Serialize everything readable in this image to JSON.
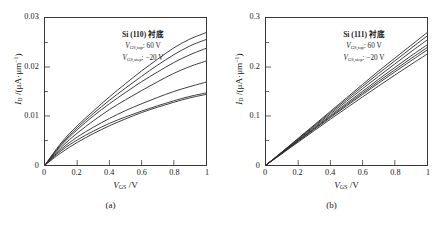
{
  "figure": {
    "panels": [
      {
        "caption": "(a)",
        "annotation": {
          "substrate": "Si (110) 衬底",
          "vgs_top_symbol": "V",
          "vgs_top_sub": "GS,top",
          "vgs_top_value": ": 60 V",
          "vgs_step_symbol": "V",
          "vgs_step_sub": "GS,step",
          "vgs_step_value": ": −20 V"
        },
        "axes": {
          "x_title_symbol": "V",
          "x_title_sub": "GS",
          "x_title_unit": " /V",
          "y_title_symbol": "I",
          "y_title_sub": "D",
          "y_title_unit": " /(μA·μm",
          "y_title_unit_sup": "−1",
          "y_title_unit_end": ")",
          "xticks": [
            "0",
            "0.2",
            "0.4",
            "0.6",
            "0.8",
            "1"
          ],
          "yticks": [
            "0",
            "0.01",
            "0.02",
            "0.03"
          ]
        },
        "chart_data": {
          "type": "line",
          "title": "Si (110) 衬底",
          "xlabel": "V_GS /V",
          "ylabel": "I_D /(μA·μm⁻¹)",
          "xlim": [
            0,
            1
          ],
          "ylim": [
            0,
            0.03
          ],
          "grid": false,
          "legend": "none",
          "x": [
            0,
            0.1,
            0.2,
            0.3,
            0.4,
            0.5,
            0.6,
            0.7,
            0.8,
            0.9,
            1.0
          ],
          "series": [
            {
              "name": "V_GS = 60 V",
              "values": [
                0,
                0.0045,
                0.008,
                0.011,
                0.0139,
                0.0166,
                0.0192,
                0.0216,
                0.0239,
                0.0257,
                0.027
              ]
            },
            {
              "name": "V_GS = 40 V",
              "values": [
                0,
                0.0042,
                0.0076,
                0.0105,
                0.0132,
                0.0157,
                0.0181,
                0.0204,
                0.0225,
                0.0243,
                0.0256
              ]
            },
            {
              "name": "V_GS = 20 V",
              "values": [
                0,
                0.004,
                0.0072,
                0.01,
                0.0125,
                0.0148,
                0.017,
                0.019,
                0.0209,
                0.0225,
                0.0238
              ]
            },
            {
              "name": "V_GS = 0 V",
              "values": [
                0,
                0.0036,
                0.0065,
                0.009,
                0.0113,
                0.0133,
                0.0152,
                0.017,
                0.0187,
                0.0201,
                0.0212
              ]
            },
            {
              "name": "V_GS = −20 V",
              "values": [
                0,
                0.0032,
                0.0057,
                0.0077,
                0.0095,
                0.0111,
                0.0125,
                0.0138,
                0.015,
                0.016,
                0.0169
              ]
            },
            {
              "name": "V_GS = −40 V",
              "values": [
                0,
                0.0029,
                0.0051,
                0.0069,
                0.0085,
                0.0098,
                0.011,
                0.0121,
                0.0131,
                0.014,
                0.0147
              ]
            },
            {
              "name": "V_GS = −60 V",
              "values": [
                0,
                0.0025,
                0.0046,
                0.0064,
                0.008,
                0.0094,
                0.0107,
                0.0118,
                0.0128,
                0.0137,
                0.0144
              ]
            }
          ]
        }
      },
      {
        "caption": "(b)",
        "annotation": {
          "substrate": "Si (111) 衬底",
          "vgs_top_symbol": "V",
          "vgs_top_sub": "GS,top",
          "vgs_top_value": ": 60 V",
          "vgs_step_symbol": "V",
          "vgs_step_sub": "GS,step",
          "vgs_step_value": ": −20 V"
        },
        "axes": {
          "x_title_symbol": "V",
          "x_title_sub": "GS",
          "x_title_unit": " /V",
          "y_title_symbol": "I",
          "y_title_sub": "D",
          "y_title_unit": " /(μA·μm",
          "y_title_unit_sup": "−1",
          "y_title_unit_end": ")",
          "xticks": [
            "0",
            "0.2",
            "0.4",
            "0.6",
            "0.8",
            "1"
          ],
          "yticks": [
            "0",
            "0.1",
            "0.2",
            "0.3"
          ]
        },
        "chart_data": {
          "type": "line",
          "title": "Si (111) 衬底",
          "xlabel": "V_GS /V",
          "ylabel": "I_D /(μA·μm⁻¹)",
          "xlim": [
            0,
            1
          ],
          "ylim": [
            0,
            0.3
          ],
          "grid": false,
          "legend": "none",
          "x": [
            0,
            0.1,
            0.2,
            0.3,
            0.4,
            0.5,
            0.6,
            0.7,
            0.8,
            0.9,
            1.0
          ],
          "series": [
            {
              "name": "V_GS = 60 V",
              "values": [
                0,
                0.027,
                0.0545,
                0.082,
                0.1095,
                0.137,
                0.1645,
                0.192,
                0.218,
                0.244,
                0.27
              ]
            },
            {
              "name": "V_GS = 40 V",
              "values": [
                0,
                0.0265,
                0.0533,
                0.0802,
                0.107,
                0.1338,
                0.1605,
                0.187,
                0.2125,
                0.238,
                0.263
              ]
            },
            {
              "name": "V_GS = 20 V",
              "values": [
                0,
                0.0258,
                0.052,
                0.0782,
                0.1042,
                0.13,
                0.1558,
                0.1812,
                0.2062,
                0.231,
                0.255
              ]
            },
            {
              "name": "V_GS = 0 V",
              "values": [
                0,
                0.025,
                0.0505,
                0.0758,
                0.101,
                0.1258,
                0.1505,
                0.175,
                0.199,
                0.2225,
                0.245
              ]
            },
            {
              "name": "V_GS = −20 V",
              "values": [
                0,
                0.0245,
                0.0494,
                0.0742,
                0.0988,
                0.123,
                0.147,
                0.1708,
                0.1942,
                0.2172,
                0.2395
              ]
            },
            {
              "name": "V_GS = −40 V",
              "values": [
                0,
                0.024,
                0.0484,
                0.0727,
                0.0968,
                0.1205,
                0.144,
                0.1672,
                0.19,
                0.2125,
                0.2345
              ]
            },
            {
              "name": "V_GS = −60 V",
              "values": [
                0,
                0.0232,
                0.0468,
                0.0702,
                0.0934,
                0.1163,
                0.139,
                0.1614,
                0.1834,
                0.205,
                0.2262
              ]
            }
          ]
        }
      }
    ]
  },
  "style": {
    "curve_color": "#2b2b2b",
    "axis_color": "#3a3a3a",
    "background": "#ffffff"
  }
}
